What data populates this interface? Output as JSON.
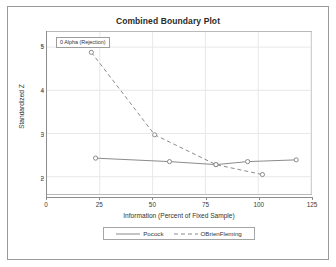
{
  "chart_data": {
    "type": "line",
    "title": "Combined Boundary Plot",
    "xlabel": "Information (Percent of Fixed Sample)",
    "ylabel": "Standardized Z",
    "xlim": [
      0,
      125
    ],
    "ylim": [
      1.6,
      5.35
    ],
    "xticks": [
      0,
      25,
      50,
      75,
      100,
      125
    ],
    "yticks": [
      2,
      3,
      4,
      5
    ],
    "grid": true,
    "legend_position": "bottom",
    "annotation": "0  Alpha (Rejection)",
    "series": [
      {
        "name": "Pocock",
        "style": "solid",
        "color": "#8a8a8a",
        "marker": "circle",
        "x": [
          23,
          58,
          80,
          95,
          118
        ],
        "y": [
          2.43,
          2.35,
          2.28,
          2.35,
          2.39
        ]
      },
      {
        "name": "OBrienFleming",
        "style": "dashed",
        "color": "#8a8a8a",
        "marker": "circle",
        "x": [
          21,
          51,
          80,
          102
        ],
        "y": [
          4.88,
          2.97,
          2.28,
          2.05
        ]
      }
    ]
  },
  "legend": {
    "entries": [
      {
        "label": "Pocock",
        "style": "solid"
      },
      {
        "label": "OBrienFleming",
        "style": "dashed"
      }
    ]
  },
  "colors": {
    "line": "#8a8a8a",
    "grid": "#e8e8e8",
    "axis": "#8d8d8d",
    "frame": "#b9b9b9",
    "outer_border": "#9a9a9a",
    "text": "#333333"
  }
}
